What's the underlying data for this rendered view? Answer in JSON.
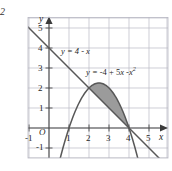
{
  "figure": {
    "corner_mark": "2",
    "background": "#ffffff",
    "grid_color": "#b9b9c4",
    "axis_color": "#4a4a4a",
    "curve_color": "#585858",
    "shade_color": "#9b9b9b"
  },
  "axes": {
    "x_label": "x",
    "y_label": "y",
    "origin_label": "O",
    "x_ticks": [
      "-1",
      "1",
      "2",
      "3",
      "4",
      "5"
    ],
    "y_ticks": [
      "-1",
      "1",
      "2",
      "3",
      "4",
      "5"
    ]
  },
  "labels": {
    "line_eq": "y = 4 - x",
    "parabola_eq_lhs": "y = ",
    "parabola_eq_a": "-4 + 5",
    "parabola_eq_x1": "x",
    "parabola_eq_b": " -",
    "parabola_eq_x2": "x",
    "parabola_eq_pow": "2"
  },
  "chart_data": {
    "type": "line",
    "title": "",
    "xlabel": "x",
    "ylabel": "y",
    "xlim": [
      -1.05,
      6.15
    ],
    "ylim": [
      -1.5,
      5.5
    ],
    "grid": true,
    "legend": "inline-annotations",
    "series": [
      {
        "name": "y = 4 - x",
        "kind": "line",
        "expression": "4 - x",
        "x": [
          -1,
          0,
          1,
          2,
          3,
          4,
          5,
          6
        ],
        "values": [
          5,
          4,
          3,
          2,
          1,
          0,
          -1,
          -2
        ]
      },
      {
        "name": "y = -4 + 5x - x^2",
        "kind": "parabola",
        "expression": "-4 + 5*x - x^2",
        "x": [
          0.5,
          1,
          1.5,
          2,
          2.5,
          3,
          3.5,
          4,
          4.5
        ],
        "values": [
          -1.75,
          0,
          1.25,
          2,
          2.25,
          2,
          1.25,
          0,
          -1.75
        ]
      }
    ],
    "shaded_region": {
      "between": [
        "y = -4 + 5x - x^2",
        "y = 4 - x"
      ],
      "x_from": 2,
      "x_to": 4,
      "color": "#9b9b9b"
    },
    "intersections": [
      [
        2,
        2
      ],
      [
        4,
        0
      ]
    ]
  }
}
